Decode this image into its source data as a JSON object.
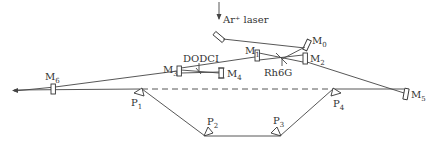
{
  "diagram": {
    "type": "optical-layout",
    "colors": {
      "line": "#444444",
      "text": "#333333",
      "background": "#ffffff"
    },
    "labels": {
      "pump": "Ar⁺ laser",
      "gain_medium": "Rh6G",
      "absorber": "DODCI",
      "m0": "M",
      "m0_sub": "0",
      "m1": "M",
      "m1_sub": "1",
      "m2": "M",
      "m2_sub": "2",
      "m3": "M",
      "m3_sub": "3",
      "m4": "M",
      "m4_sub": "4",
      "m5": "M",
      "m5_sub": "5",
      "m6": "M",
      "m6_sub": "6",
      "p1": "P",
      "p1_sub": "1",
      "p2": "P",
      "p2_sub": "2",
      "p3": "P",
      "p3_sub": "3",
      "p4": "P",
      "p4_sub": "4"
    },
    "components": [
      {
        "id": "M0",
        "kind": "mirror"
      },
      {
        "id": "M1",
        "kind": "mirror"
      },
      {
        "id": "M2",
        "kind": "mirror"
      },
      {
        "id": "M3",
        "kind": "mirror"
      },
      {
        "id": "M4",
        "kind": "mirror"
      },
      {
        "id": "M5",
        "kind": "mirror"
      },
      {
        "id": "M6",
        "kind": "output-coupler"
      },
      {
        "id": "P1",
        "kind": "prism"
      },
      {
        "id": "P2",
        "kind": "prism"
      },
      {
        "id": "P3",
        "kind": "prism"
      },
      {
        "id": "P4",
        "kind": "prism"
      }
    ]
  }
}
